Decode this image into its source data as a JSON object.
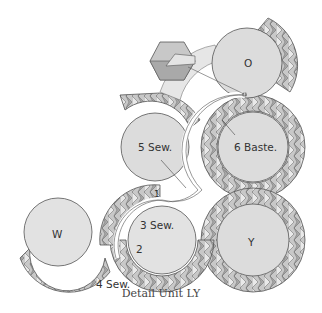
{
  "caption": "Detail Unit LY",
  "colors": {
    "circle_fill": "#dcdcdc",
    "ring_dark": "#a9a9a9",
    "ring_mid": "#c4c4c4",
    "ring_light": "#e8e8e8",
    "outline": "#555555",
    "seam": "#ffffff"
  },
  "labels": {
    "circle_o": "O",
    "circle_5": "5 Sew.",
    "circle_6": "6 Baste.",
    "circle_w": "W",
    "circle_3": "3 Sew.",
    "circle_y": "Y",
    "step_1": "1",
    "step_2": "2",
    "step_4": "4 Sew."
  }
}
